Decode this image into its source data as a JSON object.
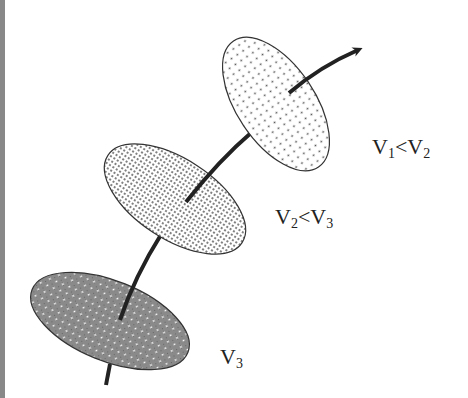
{
  "diagram": {
    "labels": {
      "top": {
        "v_a": "V",
        "sub_a": "1",
        "op": "<",
        "v_b": "V",
        "sub_b": "2"
      },
      "middle": {
        "v_a": "V",
        "sub_a": "2",
        "op": "<",
        "v_b": "V",
        "sub_b": "3"
      },
      "bottom": {
        "v_a": "V",
        "sub_a": "3"
      }
    },
    "colors": {
      "curve": "#222222",
      "outline": "#333333",
      "light_dots": "#555555",
      "dark_fill": "#8a8a8a",
      "border": "#888888"
    }
  }
}
